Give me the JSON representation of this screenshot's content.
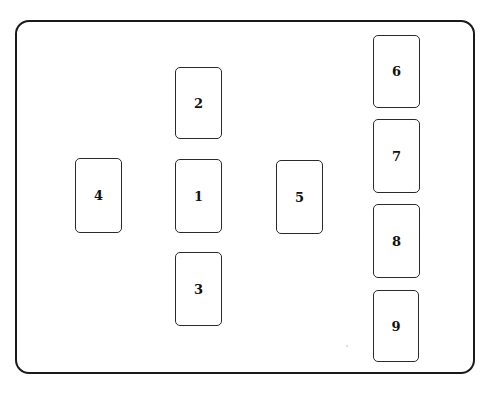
{
  "diagram": {
    "title": "",
    "frame": {
      "stroke_color": "#1a1a1a",
      "background": "#ffffff"
    },
    "cards": [
      {
        "id": 1,
        "label": "1",
        "x": 175,
        "y": 159,
        "w": 47,
        "h": 74
      },
      {
        "id": 2,
        "label": "2",
        "x": 175,
        "y": 67,
        "w": 47,
        "h": 72
      },
      {
        "id": 3,
        "label": "3",
        "x": 175,
        "y": 252,
        "w": 47,
        "h": 74
      },
      {
        "id": 4,
        "label": "4",
        "x": 75,
        "y": 158,
        "w": 47,
        "h": 75
      },
      {
        "id": 5,
        "label": "5",
        "x": 276,
        "y": 160,
        "w": 47,
        "h": 74
      },
      {
        "id": 6,
        "label": "6",
        "x": 373,
        "y": 35,
        "w": 47,
        "h": 73
      },
      {
        "id": 7,
        "label": "7",
        "x": 373,
        "y": 119,
        "w": 47,
        "h": 74
      },
      {
        "id": 8,
        "label": "8",
        "x": 373,
        "y": 204,
        "w": 47,
        "h": 74
      },
      {
        "id": 9,
        "label": "9",
        "x": 373,
        "y": 290,
        "w": 46,
        "h": 72
      }
    ]
  }
}
